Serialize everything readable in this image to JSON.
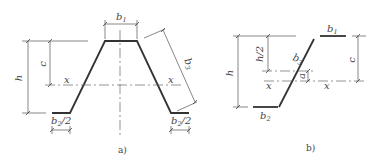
{
  "figure_a": {
    "caption": "a)",
    "labels": {
      "b1": {
        "base": "b",
        "sub": "1"
      },
      "b3": {
        "base": "b",
        "sub": "3"
      },
      "h": "h",
      "c": "c",
      "x_left": "x",
      "x_right": "x",
      "b2_half_left": {
        "base": "b",
        "sub": "2",
        "tail": "/2"
      },
      "b2_half_right": {
        "base": "b",
        "sub": "2",
        "tail": "/2"
      }
    }
  },
  "figure_b": {
    "caption": "b)",
    "labels": {
      "b1": {
        "base": "b",
        "sub": "1"
      },
      "b2": {
        "base": "b",
        "sub": "2"
      },
      "b3": {
        "base": "b",
        "sub": "3"
      },
      "h": "h",
      "h_half": "h/2",
      "c": "c",
      "a": "a",
      "x_left": "x",
      "x_right": "x"
    }
  }
}
